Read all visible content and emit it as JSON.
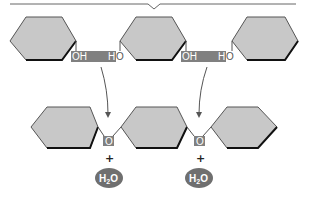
{
  "diagram": {
    "colors": {
      "hexagon_fill": "#c8c8c8",
      "hexagon_stroke": "#555555",
      "hexagon_bottom_edge": "#111111",
      "reactive_bar": "#808080",
      "oxygen_box": "#808080",
      "water_bubble": "#6f6f6f",
      "arrow": "#555555",
      "bracket": "#666666"
    },
    "top_row": {
      "monomers": [
        {
          "id": "monomer-1",
          "label": ""
        },
        {
          "id": "monomer-2",
          "label": ""
        },
        {
          "id": "monomer-3",
          "label": ""
        }
      ],
      "reaction_sites": [
        {
          "left_group": "OH",
          "right_group_h": "H",
          "right_group_o": "O"
        },
        {
          "left_group": "OH",
          "right_group_h": "H",
          "right_group_o": "O"
        }
      ]
    },
    "bottom_row": {
      "linkages": [
        {
          "bridge_atom": "O",
          "plus": "+",
          "byproduct": "H",
          "byproduct_sub": "2",
          "byproduct_tail": "O"
        },
        {
          "bridge_atom": "O",
          "plus": "+",
          "byproduct": "H",
          "byproduct_sub": "2",
          "byproduct_tail": "O"
        }
      ]
    }
  }
}
